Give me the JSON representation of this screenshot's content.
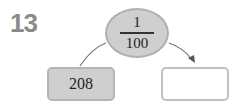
{
  "problem": {
    "number": "13"
  },
  "diagram": {
    "operator": {
      "numerator": "1",
      "denominator": "100"
    },
    "input_value": "208",
    "output_value": ""
  }
}
